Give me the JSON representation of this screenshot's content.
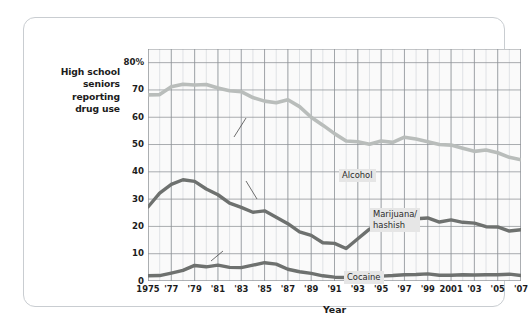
{
  "figure": {
    "y_axis_caption": [
      "High school",
      "seniors",
      "reporting",
      "drug use"
    ],
    "x_axis_title": "Year"
  },
  "chart_data": {
    "type": "line",
    "title": "",
    "xlabel": "Year",
    "ylabel": "High school seniors reporting drug use",
    "ylim": [
      0,
      85
    ],
    "xlim": [
      1975,
      2007
    ],
    "grid": true,
    "legend_position": "inline-annotations",
    "ytick_labels": [
      "80%",
      "70",
      "60",
      "50",
      "40",
      "30",
      "20",
      "10",
      "0"
    ],
    "ytick_values": [
      80,
      70,
      60,
      50,
      40,
      30,
      20,
      10,
      0
    ],
    "xtick_labels": [
      "1975",
      "'77",
      "'79",
      "'81",
      "'83",
      "'85",
      "'87",
      "'89",
      "'91",
      "'93",
      "'95",
      "'97",
      "'99",
      "2001",
      "'03",
      "'05",
      "'07"
    ],
    "xtick_values": [
      1975,
      1977,
      1979,
      1981,
      1983,
      1985,
      1987,
      1989,
      1991,
      1993,
      1995,
      1997,
      1999,
      2001,
      2003,
      2005,
      2007
    ],
    "x": [
      1975,
      1976,
      1977,
      1978,
      1979,
      1980,
      1981,
      1982,
      1983,
      1984,
      1985,
      1986,
      1987,
      1988,
      1989,
      1990,
      1991,
      1992,
      1993,
      1994,
      1995,
      1996,
      1997,
      1998,
      1999,
      2000,
      2001,
      2002,
      2003,
      2004,
      2005,
      2006,
      2007
    ],
    "series": [
      {
        "name": "Alcohol",
        "color": "#b9bdbb",
        "values": [
          68.2,
          68.3,
          71.2,
          72.1,
          71.8,
          72.0,
          70.7,
          69.7,
          69.4,
          67.2,
          65.9,
          65.3,
          66.4,
          63.9,
          60.0,
          57.1,
          54.0,
          51.3,
          51.0,
          50.1,
          51.3,
          50.8,
          52.7,
          52.0,
          51.0,
          50.0,
          49.8,
          48.6,
          47.5,
          48.0,
          47.0,
          45.3,
          44.4
        ]
      },
      {
        "name": "Marijuana/hashish",
        "color": "#6e716f",
        "values": [
          27.1,
          32.2,
          35.4,
          37.1,
          36.5,
          33.7,
          31.6,
          28.5,
          27.0,
          25.2,
          25.7,
          23.4,
          21.0,
          18.0,
          16.7,
          14.0,
          13.8,
          11.9,
          15.5,
          19.0,
          21.2,
          21.9,
          23.7,
          22.8,
          23.1,
          21.6,
          22.4,
          21.5,
          21.2,
          19.9,
          19.8,
          18.3,
          18.8
        ]
      },
      {
        "name": "Cocaine",
        "color": "#6e716f",
        "values": [
          1.9,
          2.0,
          2.9,
          3.9,
          5.7,
          5.2,
          5.8,
          5.0,
          4.9,
          5.8,
          6.7,
          6.2,
          4.3,
          3.4,
          2.8,
          1.9,
          1.4,
          1.3,
          1.3,
          1.5,
          1.8,
          2.0,
          2.3,
          2.4,
          2.6,
          2.1,
          2.1,
          2.3,
          2.2,
          2.3,
          2.3,
          2.5,
          2.0
        ]
      }
    ],
    "annotations": [
      {
        "text": "Alcohol",
        "series": "Alcohol"
      },
      {
        "text_line1": "Marijuana/",
        "text_line2": "hashish",
        "series": "Marijuana/hashish"
      },
      {
        "text": "Cocaine",
        "series": "Cocaine"
      }
    ],
    "colors": {
      "alcohol_line": "#b9bdbb",
      "marijuana_line": "#6e716f",
      "cocaine_line": "#6e716f",
      "plot_background": "#fafafa",
      "grid_major": "#8d9196",
      "grid_minor": "#d8dcdf",
      "frame_border": "#c9cdd1"
    }
  }
}
